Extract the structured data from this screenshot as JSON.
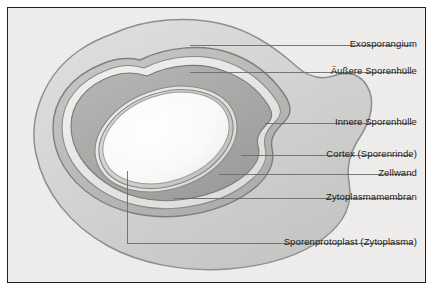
{
  "figure": {
    "kind": "labelled-biology-diagram",
    "language": "de",
    "background_color": "#eeedeb",
    "frame_color": "#231f20",
    "leader_line_color": "#6b6b6b",
    "layers": [
      {
        "key": "exosporangium",
        "label": "Exosporangium",
        "fill": "#d3d3d1"
      },
      {
        "key": "aeussere_huelle",
        "label": "Äußere Sporenhülle",
        "fill": "#b9b9b7"
      },
      {
        "key": "innere_huelle",
        "label": "Innere Sporenhülle",
        "fill": "#e6e6e4"
      },
      {
        "key": "cortex",
        "label": "Cortex (Sporenrinde)",
        "fill": "#a9a9a7"
      },
      {
        "key": "zellwand",
        "label": "Zellwand",
        "fill": "#e3e3e1"
      },
      {
        "key": "zytoplasmamembran",
        "label": "Zytoplasmamembran",
        "fill": "#cfcfcd"
      },
      {
        "key": "protoplast",
        "label": "Sporenprotoplast (Zytoplasma)",
        "fill": "#fbfbfa"
      }
    ],
    "callouts": [
      {
        "key": "exosporangium",
        "text": "Exosporangium",
        "label_y": 30,
        "line_y": 37,
        "line_x_start": 182,
        "anchor_x": 182,
        "anchor_y": 37
      },
      {
        "key": "aeussere_huelle",
        "text": "Äußere Sporenhülle",
        "label_y": 57,
        "line_y": 64,
        "line_x_start": 182,
        "anchor_x": 182,
        "anchor_y": 64
      },
      {
        "key": "innere_huelle",
        "text": "Innere Sporenhülle",
        "label_y": 108,
        "line_y": 115,
        "line_x_start": 257,
        "anchor_x": 257,
        "anchor_y": 115
      },
      {
        "key": "cortex",
        "text": "Cortex (Sporenrinde)",
        "label_y": 140,
        "line_y": 147,
        "line_x_start": 233,
        "anchor_x": 233,
        "anchor_y": 147
      },
      {
        "key": "zellwand",
        "text": "Zellwand",
        "label_y": 159,
        "line_y": 166,
        "line_x_start": 211,
        "anchor_x": 211,
        "anchor_y": 166
      },
      {
        "key": "zytoplasmamembran",
        "text": "Zytoplasmamembran",
        "label_y": 183,
        "line_y": 190,
        "line_x_start": 166,
        "anchor_x": 166,
        "anchor_y": 190
      },
      {
        "key": "protoplast",
        "text": "Sporenprotoplast (Zytoplasma)",
        "label_y": 228,
        "line_y": 235,
        "line_x_start": 119,
        "anchor_x": 119,
        "anchor_y": 163
      }
    ]
  }
}
